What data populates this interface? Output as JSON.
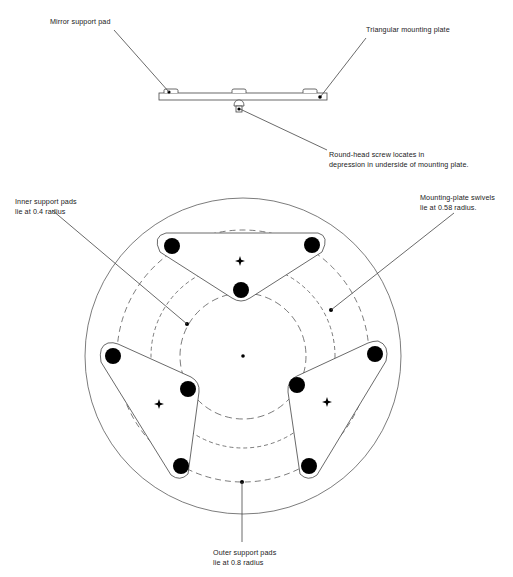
{
  "diagram": {
    "side_view": {
      "labels": {
        "mirror_pad": "Mirror support pad",
        "mounting_plate": "Triangular mounting plate",
        "screw_line1": "Round-head screw locates in",
        "screw_line2": "depression in underside of mounting plate."
      }
    },
    "plan_view": {
      "labels": {
        "inner_line1": "Inner support pads",
        "inner_line2": "lie at 0.4 radius",
        "swivel_line1": "Mounting-plate swivels",
        "swivel_line2": "lie at 0.58 radius.",
        "outer_line1": "Outer support pads",
        "outer_line2": "lie at 0.8 radius"
      },
      "radii": {
        "inner": 0.4,
        "swivel": 0.58,
        "outer": 0.8
      },
      "plate_count": 3,
      "pads_per_plate": 3
    },
    "colors": {
      "line": "#444444",
      "fill": "#000000",
      "background": "#ffffff"
    }
  }
}
